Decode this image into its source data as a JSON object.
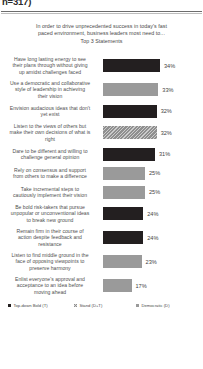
{
  "header": {
    "sample_fragment": "n=317)"
  },
  "title": {
    "line1": "In order to drive unprecedented success in today's fast",
    "line2": "paced environment, business leaders most need to...",
    "line3": "Top 3 Statements"
  },
  "legend": [
    {
      "label": "Top-down Bold (T)",
      "style": "dark",
      "color": "#231f20"
    },
    {
      "label": "Stand (D+T)",
      "style": "hatch",
      "color": "#8f8f8f"
    },
    {
      "label": "Democratic (D)",
      "style": "gray",
      "color": "#9a9a9a"
    }
  ],
  "chart_data": {
    "type": "bar",
    "orientation": "horizontal",
    "title": "In order to drive unprecedented success in today's fast paced environment, business leaders most need to... Top 3 Statements",
    "xlabel": "",
    "ylabel": "",
    "xlim": [
      0,
      40
    ],
    "grid": false,
    "legend_position": "bottom",
    "value_suffix": "%",
    "categories": [
      "Have long lasting energy to see their plans through without giving up amidst challenges faced",
      "Use a democratic and collaborative style of leadership  in achieving their vision",
      "Envision audacious ideas that don't yet exist",
      "Listen to the views of others but make their own decisions of what is right",
      "Dare to be different and willing to challenge  general opinion",
      "Rely on consensus and support from others to make a difference",
      "Take incremental steps to cautiously implement their vision",
      "Be bold risk-takers  that pursue unpopular or unconventional ideas to break new ground",
      "Remain firm in their course of action despite feedback and resistance",
      "Listen to find middle ground in the face of opposing viewpoints  to preserve harmony",
      "Enlist everyone's approval and acceptance to an idea before moving ahead"
    ],
    "values": [
      34,
      33,
      32,
      32,
      31,
      25,
      25,
      24,
      24,
      23,
      17
    ],
    "series_key": [
      "dark",
      "gray",
      "dark",
      "hatch",
      "dark",
      "gray",
      "gray",
      "dark",
      "dark",
      "gray",
      "gray"
    ]
  },
  "rows": [
    {
      "lines": [
        "Have long lasting energy to see",
        "their plans through without giving",
        "up amidst challenges faced"
      ],
      "value": 34,
      "value_label": "34%",
      "style": "dark"
    },
    {
      "lines": [
        "Use a democratic and collaborative",
        "style of leadership  in achieving",
        "their vision"
      ],
      "value": 33,
      "value_label": "33%",
      "style": "gray"
    },
    {
      "lines": [
        "Envision audacious ideas that don't",
        "yet exist"
      ],
      "value": 32,
      "value_label": "32%",
      "style": "dark"
    },
    {
      "lines": [
        "Listen to the views of others but",
        "make their own decisions of what is",
        "right"
      ],
      "value": 32,
      "value_label": "32%",
      "style": "hatch"
    },
    {
      "lines": [
        "Dare to be different and willing to",
        "challenge  general opinion"
      ],
      "value": 31,
      "value_label": "31%",
      "style": "dark"
    },
    {
      "lines": [
        "Rely on consensus and support",
        "from others to make a difference"
      ],
      "value": 25,
      "value_label": "25%",
      "style": "gray"
    },
    {
      "lines": [
        "Take incremental steps to",
        "cautiously implement their vision"
      ],
      "value": 25,
      "value_label": "25%",
      "style": "gray"
    },
    {
      "lines": [
        "Be bold risk-takers  that pursue",
        "unpopular or unconventional ideas",
        "to break new ground"
      ],
      "value": 24,
      "value_label": "24%",
      "style": "dark"
    },
    {
      "lines": [
        "Remain firm in their course of",
        "action despite feedback and",
        "resistance"
      ],
      "value": 24,
      "value_label": "24%",
      "style": "dark"
    },
    {
      "lines": [
        "Listen to find middle ground in the",
        "face of opposing viewpoints  to",
        "preserve harmony"
      ],
      "value": 23,
      "value_label": "23%",
      "style": "gray"
    },
    {
      "lines": [
        "Enlist everyone's approval and",
        "acceptance to an idea before",
        "moving ahead"
      ],
      "value": 17,
      "value_label": "17%",
      "style": "gray"
    }
  ]
}
